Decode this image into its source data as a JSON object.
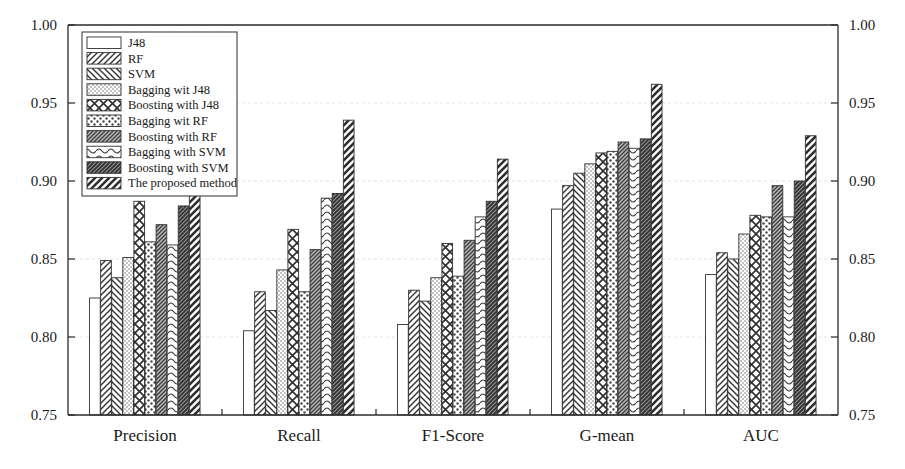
{
  "chart_data": {
    "type": "bar",
    "title": "",
    "subtitle": "",
    "xlabel": "",
    "ylabel": "",
    "ylim": [
      0.75,
      1.0
    ],
    "ytick_values": [
      0.75,
      0.8,
      0.85,
      0.9,
      0.95,
      1.0
    ],
    "ytick_labels": [
      "0.75",
      "0.80",
      "0.85",
      "0.90",
      "0.95",
      "1.00"
    ],
    "right_axis": true,
    "right_ytick_labels": [
      "0.75",
      "0.80",
      "0.85",
      "0.90",
      "0.95",
      "1.00"
    ],
    "grid": true,
    "legend_position": "upper-left",
    "categories": [
      "Precision",
      "Recall",
      "F1-Score",
      "G-mean",
      "AUC"
    ],
    "series": [
      {
        "name": "J48",
        "pattern": "blank",
        "values": [
          0.825,
          0.804,
          0.808,
          0.882,
          0.84
        ]
      },
      {
        "name": "RF",
        "pattern": "diagonal-forward",
        "values": [
          0.849,
          0.829,
          0.83,
          0.897,
          0.854
        ]
      },
      {
        "name": "SVM",
        "pattern": "diagonal-back",
        "values": [
          0.838,
          0.817,
          0.823,
          0.905,
          0.85
        ]
      },
      {
        "name": "Bagging wit J48",
        "pattern": "dots-fine",
        "values": [
          0.851,
          0.843,
          0.838,
          0.911,
          0.866
        ]
      },
      {
        "name": "Boosting with J48",
        "pattern": "crosshatch-diamond",
        "values": [
          0.887,
          0.869,
          0.86,
          0.918,
          0.878
        ]
      },
      {
        "name": "Bagging wit RF",
        "pattern": "dots-coarse",
        "values": [
          0.861,
          0.829,
          0.839,
          0.919,
          0.877
        ]
      },
      {
        "name": "Boosting with RF",
        "pattern": "hatch-dense",
        "values": [
          0.872,
          0.856,
          0.862,
          0.925,
          0.897
        ]
      },
      {
        "name": "Bagging with SVM",
        "pattern": "wave",
        "values": [
          0.859,
          0.889,
          0.877,
          0.921,
          0.877
        ]
      },
      {
        "name": "Boosting with SVM",
        "pattern": "hatch-solid-dark",
        "values": [
          0.884,
          0.892,
          0.887,
          0.927,
          0.9
        ]
      },
      {
        "name": "The proposed method",
        "pattern": "thick-diagonal",
        "values": [
          0.906,
          0.939,
          0.914,
          0.962,
          0.929
        ]
      }
    ]
  },
  "legend": {
    "items": [
      "J48",
      "RF",
      "SVM",
      "Bagging wit J48",
      "Boosting with J48",
      "Bagging wit RF",
      "Boosting with RF",
      "Bagging with SVM",
      "Boosting with SVM",
      "The proposed method"
    ]
  },
  "axes": {
    "left_ticks": [
      "1.00",
      "0.95",
      "0.90",
      "0.85",
      "0.80",
      "0.75"
    ],
    "right_ticks": [
      "1.00",
      "0.95",
      "0.90",
      "0.85",
      "0.80",
      "0.75"
    ],
    "categories": [
      "Precision",
      "Recall",
      "F1-Score",
      "G-mean",
      "AUC"
    ]
  },
  "colors": {
    "axis": "#2b2b2b",
    "grid": "#d9d9d9",
    "bar_outline": "#303030",
    "background": "#ffffff",
    "text": "#1a1a1a"
  }
}
